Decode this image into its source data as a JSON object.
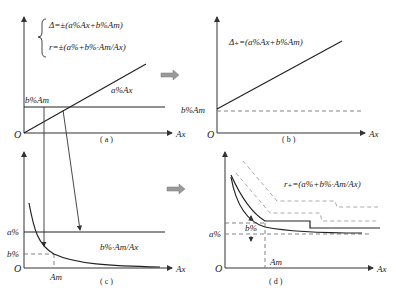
{
  "figure": {
    "panels": {
      "a": {
        "caption": "( a )",
        "formula_1": "Δ=±(a%Ax+b%Am)",
        "formula_2": "r=±(a%+b%·Am/Ax)",
        "line_labels": {
          "proportional": "a%Ax",
          "constant": "b%Am"
        },
        "axis": {
          "origin": "O",
          "x": "Ax"
        }
      },
      "b": {
        "caption": "( b )",
        "formula": "Δ₊=(a%Ax+b%Am)",
        "intercept_label": "b%Am",
        "axis": {
          "origin": "O",
          "x": "Ax"
        }
      },
      "c": {
        "caption": "( c )",
        "y_labels": {
          "a": "a%",
          "b": "b%"
        },
        "curve_label": "b%·Am/Ax",
        "x_marker": "Am",
        "axis": {
          "origin": "O",
          "x": "Ax"
        }
      },
      "d": {
        "caption": "( d )",
        "formula": "r₊=(a%+b%·Am/Ax)",
        "y_labels": {
          "a": "a%",
          "b": "b%"
        },
        "x_marker": "Am",
        "axis": {
          "origin": "O",
          "x": "Ax"
        }
      }
    },
    "transition_arrows": [
      "a→b",
      "c→d"
    ],
    "colors": {
      "line": "#222222",
      "dashed": "#777777",
      "light_dashed": "#aaaaaa",
      "arrow_fill": "#9a9a9a"
    }
  }
}
